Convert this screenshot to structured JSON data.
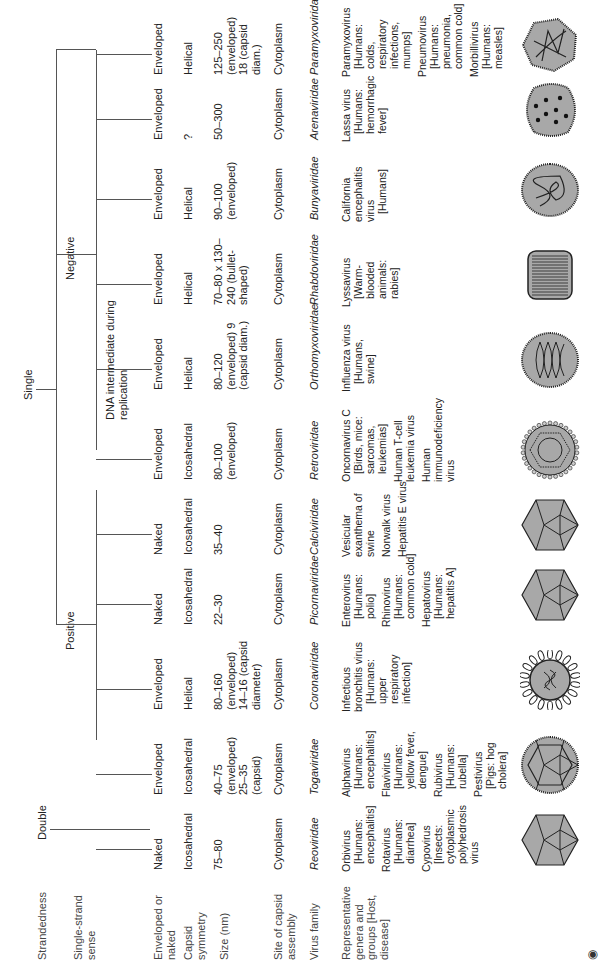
{
  "row_labels": {
    "strandedness": "Strandedness",
    "sense": "Single-strand sense",
    "envelope": "Enveloped or naked",
    "symmetry": "Capsid symmetry",
    "size": "Size (nm)",
    "assembly": "Site of capsid assembly",
    "family": "Virus family",
    "reps": "Representative genera and groups [Host, disease]"
  },
  "tree": {
    "double": "Double",
    "single": "Single",
    "positive": "Positive",
    "negative": "Negative",
    "dna_intermediate": "DNA intermediate during replication"
  },
  "columns": [
    {
      "envelope": "Naked",
      "symmetry": "Icosahedral",
      "size": "75–80",
      "assembly": "Cytoplasm",
      "family": "Reoviridae",
      "reps": [
        {
          "g": "Orbivirus",
          "h": "[Humans: encephalitis]"
        },
        {
          "g": "Rotavirus",
          "h": "[Humans: diarrhea]"
        },
        {
          "g": "Cypovirus",
          "h": "[Insects: cytoplasmic polyhedrosis virus"
        }
      ],
      "shape": "icosa"
    },
    {
      "envelope": "Enveloped",
      "symmetry": "Icosahedral",
      "size": "40–75 (enveloped) 25–35 (capsid)",
      "assembly": "Cytoplasm",
      "family": "Togaviridae",
      "reps": [
        {
          "g": "Alphavirus",
          "h": "[Humans: encephalitis]"
        },
        {
          "g": "Flavivirus",
          "h": "[Humans: yellow fever, dengue]"
        },
        {
          "g": "Rubivirus",
          "h": "[Humans: rubella]"
        },
        {
          "g": "Pestivirus",
          "h": "[Pigs: hog cholera]"
        }
      ],
      "shape": "icosa-env"
    },
    {
      "envelope": "Enveloped",
      "symmetry": "Helical",
      "size": "80–160 (enveloped) 14–16 (capsid diameter)",
      "assembly": "Cytoplasm",
      "family": "Coronaviridae",
      "reps": [
        {
          "g": "Infectious bronchitis virus",
          "h": "[Humans: upper respiratory infection]"
        }
      ],
      "shape": "corona"
    },
    {
      "envelope": "Naked",
      "symmetry": "Icosahedral",
      "size": "22–30",
      "assembly": "Cytoplasm",
      "family": "Picornaviridae",
      "reps": [
        {
          "g": "Enterovirus",
          "h": "[Humans: polio]"
        },
        {
          "g": "Rhinovirus",
          "h": "[Humans: common cold]"
        },
        {
          "g": "Hepatovirus",
          "h": "[Humans: hepatitis A]"
        }
      ],
      "shape": "icosa"
    },
    {
      "envelope": "Naked",
      "symmetry": "Icosahedral",
      "size": "35–40",
      "assembly": "Cytoplasm",
      "family": "Calciviridae",
      "reps": [
        {
          "g": "Vesicular exanthema of swine",
          "h": ""
        },
        {
          "g": "Norwalk virus",
          "h": ""
        },
        {
          "g": "Hepatitis E virus",
          "h": ""
        }
      ],
      "shape": "icosa"
    },
    {
      "envelope": "Enveloped",
      "symmetry": "Icosahedral",
      "size": "80–100 (enveloped)",
      "assembly": "Cytoplasm",
      "family": "Retroviridae",
      "reps": [
        {
          "g": "Oncornavirus C",
          "h": "[Birds, mice: sarcomas, leukemias]"
        },
        {
          "g": "Human T-cell leukemia virus",
          "h": ""
        },
        {
          "g": "Human immunodeficiency virus",
          "h": ""
        }
      ],
      "shape": "retro"
    },
    {
      "envelope": "Enveloped",
      "symmetry": "Helical",
      "size": "80–120 (enveloped) 9 (capsid diam.)",
      "assembly": "Cytoplasm",
      "family": "Orthomyxoviridae",
      "reps": [
        {
          "g": "Influenza virus",
          "h": "[Humans, swine]"
        }
      ],
      "shape": "coil"
    },
    {
      "envelope": "Enveloped",
      "symmetry": "Helical",
      "size": "70–80 x 130–240 (bullet-shaped)",
      "assembly": "Cytoplasm",
      "family": "Rhabdoviridae",
      "reps": [
        {
          "g": "Lyssavirus",
          "h": "[Warm-blooded animals: rabies]"
        }
      ],
      "shape": "bullet"
    },
    {
      "envelope": "Enveloped",
      "symmetry": "Helical",
      "size": "90–100 (enveloped)",
      "assembly": "Cytoplasm",
      "family": "Bunyaviridae",
      "reps": [
        {
          "g": "California encephalitis virus",
          "h": "[Humans]"
        }
      ],
      "shape": "tangle"
    },
    {
      "envelope": "Enveloped",
      "symmetry": "?",
      "size": "50–300",
      "assembly": "Cytoplasm",
      "family": "Arenaviridae",
      "reps": [
        {
          "g": "Lassa virus",
          "h": "[Humans: hemorrhagic fever]"
        }
      ],
      "shape": "dots"
    },
    {
      "envelope": "Enveloped",
      "symmetry": "Helical",
      "size": "125–250 (enveloped) 18 (capsid diam.)",
      "assembly": "Cytoplasm",
      "family": "Paramyxoviridae",
      "reps": [
        {
          "g": "Paramyxovirus",
          "h": "[Humans: colds, respiratory infections, mumps]"
        },
        {
          "g": "Pneumovirus",
          "h": "[Humans: pneumonia, common cold]"
        },
        {
          "g": "Morbillivirus",
          "h": "[Humans: measles]"
        }
      ],
      "shape": "tangle2"
    }
  ],
  "colors": {
    "line": "#555555",
    "fill": "#a8a8a8",
    "stroke": "#222222"
  }
}
